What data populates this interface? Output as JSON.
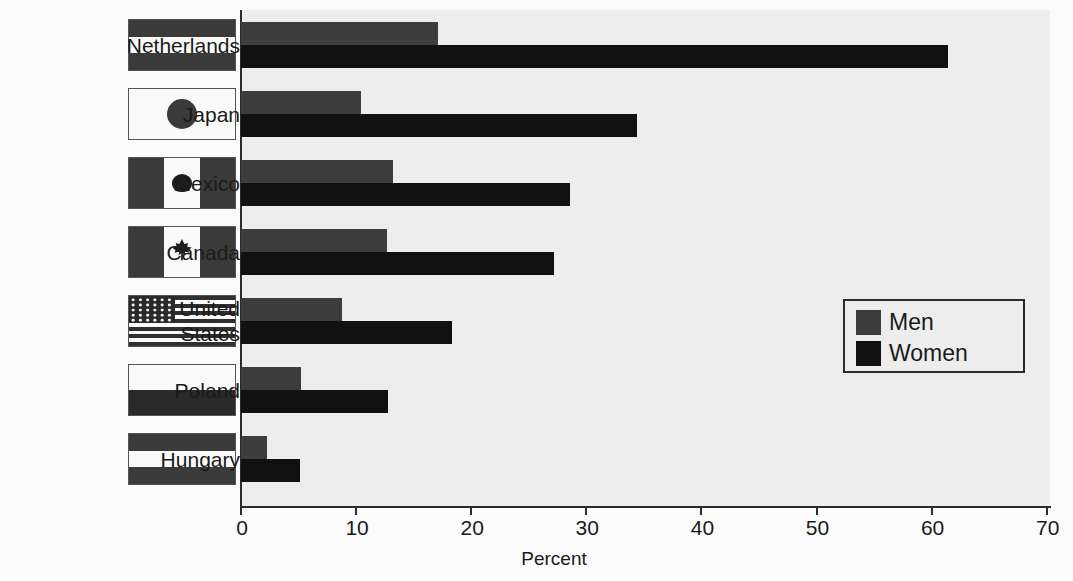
{
  "chart_data": {
    "type": "bar",
    "orientation": "horizontal",
    "title": "",
    "xlabel": "Percent",
    "ylabel": "",
    "xlim": [
      0,
      70
    ],
    "xticks": [
      0,
      10,
      20,
      30,
      40,
      50,
      60,
      70
    ],
    "xtick_labels": [
      "0",
      "10",
      "20",
      "30",
      "40",
      "50",
      "60",
      "70"
    ],
    "grid": false,
    "legend_position": "center-right",
    "categories": [
      "Netherlands",
      "Japan",
      "Mexico",
      "Canada",
      "United States",
      "Poland",
      "Hungary"
    ],
    "series": [
      {
        "name": "Men",
        "color": "#3d3d3d",
        "values": [
          17.1,
          10.4,
          13.2,
          12.7,
          8.8,
          5.2,
          2.3
        ]
      },
      {
        "name": "Women",
        "color": "#111111",
        "values": [
          61.4,
          34.4,
          28.6,
          27.2,
          18.3,
          12.8,
          5.1
        ]
      }
    ]
  },
  "legend": {
    "items": [
      {
        "label": "Men",
        "color": "#3d3d3d"
      },
      {
        "label": "Women",
        "color": "#111111"
      }
    ]
  },
  "axis": {
    "x_title": "Percent"
  },
  "categories": [
    {
      "label": "Netherlands",
      "label_lines": [
        "Netherlands"
      ],
      "flag": "netherlands-flag"
    },
    {
      "label": "Japan",
      "label_lines": [
        "Japan"
      ],
      "flag": "japan-flag"
    },
    {
      "label": "Mexico",
      "label_lines": [
        "Mexico"
      ],
      "flag": "mexico-flag"
    },
    {
      "label": "Canada",
      "label_lines": [
        "Canada"
      ],
      "flag": "canada-flag"
    },
    {
      "label": "United States",
      "label_lines": [
        "United",
        "States"
      ],
      "flag": "united-states-flag"
    },
    {
      "label": "Poland",
      "label_lines": [
        "Poland"
      ],
      "flag": "poland-flag"
    },
    {
      "label": "Hungary",
      "label_lines": [
        "Hungary"
      ],
      "flag": "hungary-flag"
    }
  ],
  "colors": {
    "plot_background": "#ededed",
    "page_background": "#fbfbfb",
    "axis": "#2b2b2b",
    "men": "#3d3d3d",
    "women": "#111111"
  }
}
